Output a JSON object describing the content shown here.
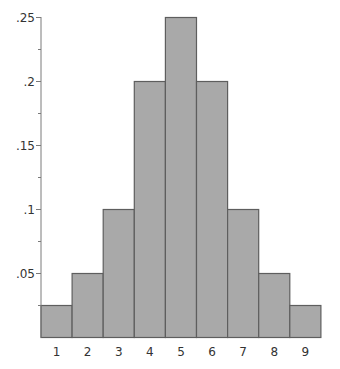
{
  "chart_data": {
    "type": "bar",
    "title": "",
    "xlabel": "",
    "ylabel": "",
    "categories": [
      "1",
      "2",
      "3",
      "4",
      "5",
      "6",
      "7",
      "8",
      "9"
    ],
    "values": [
      0.025,
      0.05,
      0.1,
      0.2,
      0.25,
      0.2,
      0.1,
      0.05,
      0.025
    ],
    "ylim": [
      0,
      0.25
    ],
    "y_ticks": [
      {
        "value": 0.05,
        "label": ".05"
      },
      {
        "value": 0.1,
        "label": ".1"
      },
      {
        "value": 0.15,
        "label": ".15"
      },
      {
        "value": 0.2,
        "label": ".2"
      },
      {
        "value": 0.25,
        "label": ".25"
      }
    ],
    "y_minor_ticks": [
      0.025,
      0.075,
      0.125,
      0.175,
      0.225
    ],
    "grid": false,
    "legend": null,
    "bar_fill": "#a9a9a9",
    "bar_stroke": "#5e5e5e",
    "axis_color": "#7a7a7a"
  }
}
